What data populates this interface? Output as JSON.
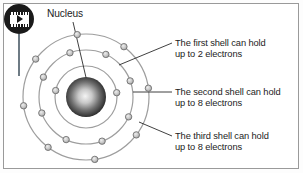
{
  "figure": {
    "background_color": "#ffffff",
    "border_color": "#9a9a9a",
    "text_color": "#1c1c1c"
  },
  "badge": {
    "name": "video-icon",
    "shape": "filmstrip-with-play-triangle",
    "background_color": "#1a1a1a",
    "foreground_color": "#ffffff"
  },
  "labels": {
    "nucleus": "Nucleus",
    "shell1": "The first shell can hold\nup to 2 electrons",
    "shell2": "The second shell can hold\nup to 8 electrons",
    "shell3": "The third shell can hold\nup to 8 electrons"
  },
  "atom": {
    "center_x": 86,
    "center_y": 97,
    "nucleus_radius": 20,
    "nucleus_color_center": "#f2f2f2",
    "nucleus_color_edge": "#1f1f1f",
    "shell_stroke": "#9e9e9e",
    "electron_fill": "#c9c9c9",
    "electron_stroke": "#707070",
    "electron_radius": 3.2,
    "shells": [
      {
        "index": 1,
        "name": "first-shell",
        "radius": 31,
        "electron_count": 2,
        "capacity": 2,
        "electron_angles": [
          168,
          8
        ]
      },
      {
        "index": 2,
        "name": "second-shell",
        "radius": 47,
        "electron_count": 8,
        "capacity": 8,
        "electron_angles": [
          200,
          245,
          290,
          335,
          20,
          65,
          110,
          155
        ]
      },
      {
        "index": 3,
        "name": "third-shell",
        "radius": 63,
        "electron_count": 8,
        "capacity": 8,
        "electron_angles": [
          188,
          233,
          278,
          323,
          8,
          53,
          98,
          143
        ]
      }
    ]
  },
  "leaders": {
    "nucleus": {
      "x1": 73,
      "y1": 22,
      "x2": 88,
      "y2": 86
    },
    "shell1": {
      "x1": 172,
      "y1": 43,
      "x2": 119,
      "y2": 65
    },
    "shell2": {
      "x1": 172,
      "y1": 92,
      "x2": 133,
      "y2": 92
    },
    "shell3": {
      "x1": 172,
      "y1": 136,
      "x2": 139,
      "y2": 122
    }
  }
}
